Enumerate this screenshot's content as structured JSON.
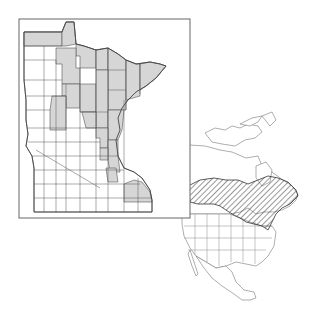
{
  "figure": {
    "type": "species-distribution-map",
    "panels": [
      {
        "name": "minnesota-county-map",
        "description": "Minnesota counties, occupied counties shaded gray",
        "frame": {
          "x": 19,
          "y": 19,
          "width": 171,
          "height": 199
        }
      },
      {
        "name": "north-america-range-map",
        "description": "North America with hatched range across southern Canada / Great Lakes / New England"
      }
    ],
    "colors": {
      "background": "#ffffff",
      "shaded_county": "#d6d6d6",
      "outline": "#555555",
      "frame": "#666666",
      "hatch": "#333333"
    }
  }
}
